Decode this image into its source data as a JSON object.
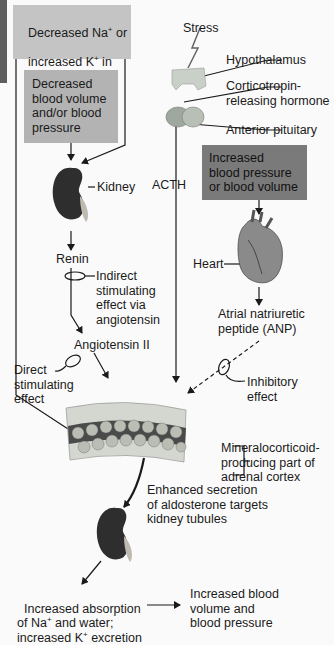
{
  "colors": {
    "box_light": "#c4c4c4",
    "box_mid": "#b3b3b3",
    "box_dark": "#7a7a7a",
    "left_strip": "#5e5e5e",
    "line": "#1a1a1a"
  },
  "boxes": {
    "sodium_potassium": {
      "line1": "Decreased Na",
      "sup1": "+",
      "line1b": " or",
      "line2": "increased K",
      "sup2": "+",
      "line2b": " in",
      "line3": "blood"
    },
    "blood_volume": {
      "text": "Decreased\nblood volume\nand/or blood\npressure"
    },
    "increased_bp": {
      "text": "Increased\nblood pressure\nor blood volume"
    }
  },
  "labels": {
    "stress": "Stress",
    "hypothalamus": "Hypothalamus",
    "crh": "Corticotropin-\nreleasing hormone",
    "anterior_pituitary": "Anterior pituitary",
    "acth": "ACTH",
    "kidney": "Kidney",
    "heart": "Heart",
    "renin": "Renin",
    "indirect_effect": "Indirect\nstimulating\neffect via\nangiotensin",
    "angiotensin_ii": "Angiotensin II",
    "anp": "Atrial natriuretic\npeptide (ANP)",
    "direct_effect": "Direct\nstimulating\neffect",
    "inhibitory_effect": "Inhibitory\neffect",
    "adrenal_cortex": "Mineralocorticoid-\nproducing part of\nadrenal cortex",
    "aldosterone": "Enhanced secretion\nof aldosterone targets\nkidney tubules",
    "absorption": {
      "line1": "Increased absorption",
      "line2a": "of Na",
      "sup2": "+",
      "line2b": " and water;",
      "line3a": "increased K",
      "sup3": "+",
      "line3b": " excretion"
    },
    "result": "Increased blood\nvolume and\nblood pressure"
  }
}
